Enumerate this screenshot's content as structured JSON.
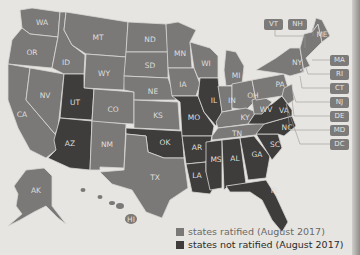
{
  "map": {
    "colors": {
      "ratified": "#7a7977",
      "not_ratified": "#3e3d3c",
      "background": "#e6e5e2"
    },
    "states_ratified": [
      "WA",
      "OR",
      "CA",
      "NV",
      "ID",
      "MT",
      "WY",
      "CO",
      "NM",
      "TX",
      "ND",
      "SD",
      "NE",
      "KS",
      "MN",
      "IA",
      "WI",
      "MI",
      "IN",
      "OH",
      "KY",
      "TN",
      "WV",
      "PA",
      "NY",
      "ME",
      "VT",
      "NH",
      "MA",
      "RI",
      "CT",
      "NJ",
      "DE",
      "MD",
      "DC",
      "AK",
      "HI"
    ],
    "states_not_ratified": [
      "UT",
      "AZ",
      "OK",
      "MO",
      "AR",
      "LA",
      "IL",
      "MS",
      "AL",
      "GA",
      "FL",
      "SC",
      "NC",
      "VA"
    ],
    "labels": {
      "WA": "WA",
      "OR": "OR",
      "CA": "CA",
      "NV": "NV",
      "ID": "ID",
      "MT": "MT",
      "WY": "WY",
      "UT": "UT",
      "CO": "CO",
      "AZ": "AZ",
      "NM": "NM",
      "ND": "ND",
      "SD": "SD",
      "NE": "NE",
      "KS": "KS",
      "OK": "OK",
      "TX": "TX",
      "MN": "MN",
      "IA": "IA",
      "MO": "MO",
      "AR": "AR",
      "LA": "LA",
      "WI": "WI",
      "IL": "IL",
      "MI": "MI",
      "IN": "IN",
      "OH": "OH",
      "KY": "KY",
      "TN": "TN",
      "MS": "MS",
      "AL": "AL",
      "GA": "GA",
      "FL": "FL",
      "SC": "SC",
      "NC": "NC",
      "VA": "VA",
      "WV": "WV",
      "PA": "PA",
      "NY": "NY",
      "ME": "ME",
      "AK": "AK",
      "HI": "HI"
    },
    "callouts": {
      "VT": "VT",
      "NH": "NH",
      "MA": "MA",
      "RI": "RI",
      "CT": "CT",
      "NJ": "NJ",
      "DE": "DE",
      "MD": "MD",
      "DC": "DC"
    }
  },
  "legend": {
    "items": [
      {
        "label": "states ratified (August 2017)",
        "color": "#7a7977"
      },
      {
        "label": "states not ratified (August 2017)",
        "color": "#3e3d3c"
      }
    ]
  }
}
